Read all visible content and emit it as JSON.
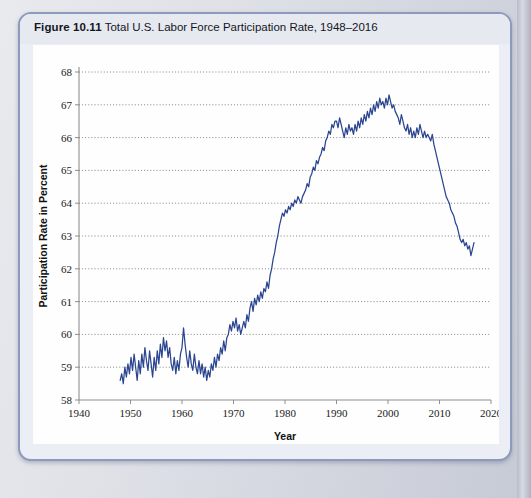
{
  "figure": {
    "number": "Figure 10.11",
    "title": "Total U.S. Labor Force Participation Rate, 1948–2016"
  },
  "chart_data": {
    "type": "line",
    "title": "Total U.S. Labor Force Participation Rate, 1948–2016",
    "xlabel": "Year",
    "ylabel": "Participation Rate in Percent",
    "xlim": [
      1940,
      2020
    ],
    "ylim": [
      58,
      68
    ],
    "xticks": [
      1940,
      1950,
      1960,
      1970,
      1980,
      1990,
      2000,
      2010,
      2020
    ],
    "yticks": [
      58,
      59,
      60,
      61,
      62,
      63,
      64,
      65,
      66,
      67,
      68
    ],
    "grid": "horizontal-dotted",
    "legend": "none",
    "series_color": "#2b4590",
    "series": [
      {
        "name": "Total U.S. Labor Force Participation Rate",
        "x": [
          1948.0,
          1948.3,
          1948.6,
          1948.9,
          1949.2,
          1949.5,
          1949.8,
          1950.1,
          1950.4,
          1950.7,
          1951.0,
          1951.3,
          1951.6,
          1951.9,
          1952.2,
          1952.5,
          1952.8,
          1953.1,
          1953.4,
          1953.7,
          1954.0,
          1954.3,
          1954.6,
          1954.9,
          1955.2,
          1955.5,
          1955.8,
          1956.1,
          1956.4,
          1956.7,
          1957.0,
          1957.3,
          1957.6,
          1957.9,
          1958.2,
          1958.5,
          1958.8,
          1959.1,
          1959.4,
          1959.7,
          1960.0,
          1960.3,
          1960.6,
          1960.9,
          1961.2,
          1961.5,
          1961.8,
          1962.1,
          1962.4,
          1962.7,
          1963.0,
          1963.3,
          1963.6,
          1963.9,
          1964.2,
          1964.5,
          1964.8,
          1965.1,
          1965.4,
          1965.7,
          1966.0,
          1966.3,
          1966.6,
          1966.9,
          1967.2,
          1967.5,
          1967.8,
          1968.1,
          1968.4,
          1968.7,
          1969.0,
          1969.3,
          1969.6,
          1969.9,
          1970.2,
          1970.5,
          1970.8,
          1971.1,
          1971.4,
          1971.7,
          1972.0,
          1972.3,
          1972.6,
          1972.9,
          1973.2,
          1973.5,
          1973.8,
          1974.1,
          1974.4,
          1974.7,
          1975.0,
          1975.3,
          1975.6,
          1975.9,
          1976.2,
          1976.5,
          1976.8,
          1977.1,
          1977.4,
          1977.7,
          1978.0,
          1978.3,
          1978.6,
          1978.9,
          1979.2,
          1979.5,
          1979.8,
          1980.1,
          1980.4,
          1980.7,
          1981.0,
          1981.3,
          1981.6,
          1981.9,
          1982.2,
          1982.5,
          1982.8,
          1983.1,
          1983.4,
          1983.7,
          1984.0,
          1984.3,
          1984.6,
          1984.9,
          1985.2,
          1985.5,
          1985.8,
          1986.1,
          1986.4,
          1986.7,
          1987.0,
          1987.3,
          1987.6,
          1987.9,
          1988.2,
          1988.5,
          1988.8,
          1989.1,
          1989.4,
          1989.7,
          1990.0,
          1990.3,
          1990.6,
          1990.9,
          1991.2,
          1991.5,
          1991.8,
          1992.1,
          1992.4,
          1992.7,
          1993.0,
          1993.3,
          1993.6,
          1993.9,
          1994.2,
          1994.5,
          1994.8,
          1995.1,
          1995.4,
          1995.7,
          1996.0,
          1996.3,
          1996.6,
          1996.9,
          1997.2,
          1997.5,
          1997.8,
          1998.1,
          1998.4,
          1998.7,
          1999.0,
          1999.3,
          1999.6,
          1999.9,
          2000.2,
          2000.5,
          2000.8,
          2001.1,
          2001.4,
          2001.7,
          2002.0,
          2002.3,
          2002.6,
          2002.9,
          2003.2,
          2003.5,
          2003.8,
          2004.1,
          2004.4,
          2004.7,
          2005.0,
          2005.3,
          2005.6,
          2005.9,
          2006.2,
          2006.5,
          2006.8,
          2007.1,
          2007.4,
          2007.7,
          2008.0,
          2008.3,
          2008.6,
          2008.9,
          2009.2,
          2009.5,
          2009.8,
          2010.1,
          2010.4,
          2010.7,
          2011.0,
          2011.3,
          2011.6,
          2011.9,
          2012.2,
          2012.5,
          2012.8,
          2013.1,
          2013.4,
          2013.7,
          2014.0,
          2014.3,
          2014.6,
          2014.9,
          2015.2,
          2015.5,
          2015.8,
          2016.1,
          2016.4,
          2016.7
        ],
        "y": [
          58.6,
          58.8,
          58.5,
          59.0,
          58.7,
          59.1,
          58.8,
          59.3,
          58.9,
          59.4,
          59.0,
          58.6,
          59.2,
          58.8,
          59.4,
          59.0,
          59.6,
          59.2,
          58.9,
          59.5,
          59.1,
          58.7,
          59.3,
          58.9,
          59.5,
          59.1,
          59.7,
          59.3,
          59.9,
          59.5,
          59.8,
          59.3,
          59.6,
          59.1,
          58.9,
          59.3,
          58.8,
          59.2,
          58.9,
          59.4,
          59.6,
          60.2,
          59.7,
          59.3,
          59.0,
          59.5,
          59.1,
          58.9,
          59.4,
          59.0,
          58.8,
          59.2,
          58.8,
          59.1,
          58.7,
          59.0,
          58.6,
          58.9,
          58.7,
          59.1,
          58.9,
          59.3,
          59.0,
          59.4,
          59.2,
          59.6,
          59.4,
          59.8,
          59.5,
          59.9,
          60.0,
          60.3,
          60.1,
          60.4,
          60.2,
          60.5,
          60.1,
          60.3,
          60.0,
          60.2,
          60.4,
          60.2,
          60.6,
          60.4,
          60.8,
          61.0,
          60.7,
          61.1,
          60.9,
          61.2,
          61.0,
          61.3,
          61.1,
          61.4,
          61.3,
          61.6,
          61.4,
          61.8,
          62.0,
          62.3,
          62.5,
          62.8,
          63.0,
          63.3,
          63.5,
          63.7,
          63.6,
          63.8,
          63.7,
          63.9,
          63.8,
          64.0,
          63.9,
          64.1,
          64.0,
          64.2,
          64.1,
          64.0,
          64.2,
          64.3,
          64.4,
          64.6,
          64.5,
          64.8,
          64.9,
          65.1,
          65.0,
          65.3,
          65.2,
          65.4,
          65.5,
          65.7,
          65.6,
          65.9,
          66.0,
          66.2,
          66.1,
          66.4,
          66.3,
          66.5,
          66.5,
          66.3,
          66.6,
          66.4,
          66.2,
          66.0,
          66.3,
          66.1,
          66.4,
          66.2,
          66.3,
          66.1,
          66.4,
          66.2,
          66.5,
          66.3,
          66.6,
          66.4,
          66.7,
          66.5,
          66.8,
          66.6,
          66.9,
          66.7,
          67.0,
          66.8,
          67.1,
          66.9,
          67.2,
          67.0,
          67.1,
          66.9,
          67.2,
          67.0,
          67.3,
          67.1,
          66.9,
          67.0,
          66.8,
          66.7,
          66.6,
          66.4,
          66.7,
          66.5,
          66.3,
          66.2,
          66.4,
          66.1,
          66.3,
          66.0,
          66.2,
          66.0,
          66.3,
          66.1,
          66.4,
          66.2,
          66.0,
          66.2,
          66.0,
          66.1,
          66.0,
          65.9,
          66.1,
          65.8,
          65.6,
          65.4,
          65.2,
          65.0,
          64.8,
          64.6,
          64.4,
          64.2,
          64.1,
          64.0,
          63.8,
          63.7,
          63.6,
          63.4,
          63.3,
          63.1,
          62.9,
          62.8,
          62.9,
          62.7,
          62.8,
          62.6,
          62.7,
          62.4,
          62.6,
          62.8
        ]
      }
    ]
  }
}
